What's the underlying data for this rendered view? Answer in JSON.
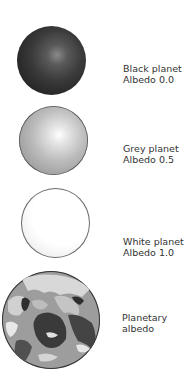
{
  "figure": {
    "planets": [
      {
        "name": "Black planet",
        "albedo_label": "Albedo 0.0",
        "albedo": 0.0,
        "color": "#262626"
      },
      {
        "name": "Grey planet",
        "albedo_label": "Albedo 0.5",
        "albedo": 0.5,
        "color": "#b0b0b0"
      },
      {
        "name": "White planet",
        "albedo_label": "Albedo 1.0",
        "albedo": 1.0,
        "color": "#ffffff"
      },
      {
        "name": "Planetary",
        "albedo_label": "albedo",
        "color": "#9d9d9d"
      }
    ]
  }
}
